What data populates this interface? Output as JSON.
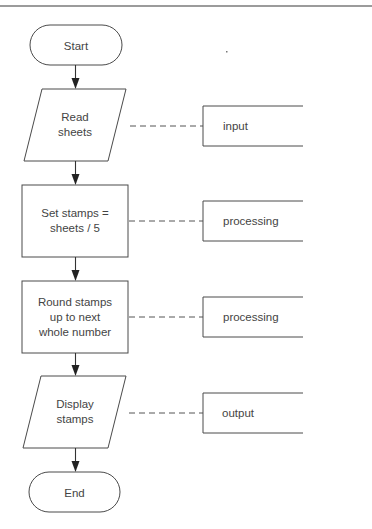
{
  "diagram": {
    "type": "flowchart",
    "nodes": [
      {
        "id": "start",
        "shape": "terminal",
        "lines": [
          "Start"
        ]
      },
      {
        "id": "read",
        "shape": "parallelogram",
        "lines": [
          "Read",
          "sheets"
        ],
        "annotation": "input"
      },
      {
        "id": "set",
        "shape": "process",
        "lines": [
          "Set stamps =",
          "sheets / 5"
        ],
        "annotation": "processing"
      },
      {
        "id": "round",
        "shape": "process",
        "lines": [
          "Round stamps",
          "up to next",
          "whole number"
        ],
        "annotation": "processing"
      },
      {
        "id": "display",
        "shape": "parallelogram",
        "lines": [
          "Display",
          "stamps"
        ],
        "annotation": "output"
      },
      {
        "id": "end",
        "shape": "terminal",
        "lines": [
          "End"
        ]
      }
    ],
    "edges": [
      {
        "from": "start",
        "to": "read"
      },
      {
        "from": "read",
        "to": "set"
      },
      {
        "from": "set",
        "to": "round"
      },
      {
        "from": "round",
        "to": "display"
      },
      {
        "from": "display",
        "to": "end"
      }
    ],
    "annotations": {
      "read": "input",
      "set": "processing",
      "round": "processing",
      "display": "output"
    },
    "colors": {
      "stroke": "#4a4a4a",
      "text": "#444444",
      "background": "#ffffff",
      "rule": "#7a7a7a"
    }
  }
}
